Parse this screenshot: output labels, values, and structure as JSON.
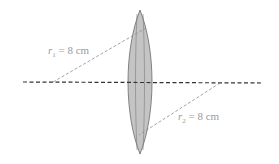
{
  "diagram": {
    "colors": {
      "lens_fill": "#c4c4c4",
      "lens_stroke": "#6a6a6a",
      "axis": "#333333",
      "radius_line": "#8a8a8a",
      "label": "#9a9a9a"
    },
    "labels": {
      "r1": {
        "symbol": "r",
        "subscript": "1",
        "value": "= 8 cm"
      },
      "r2": {
        "symbol": "r",
        "subscript": "2",
        "value": "= 8 cm"
      }
    }
  }
}
